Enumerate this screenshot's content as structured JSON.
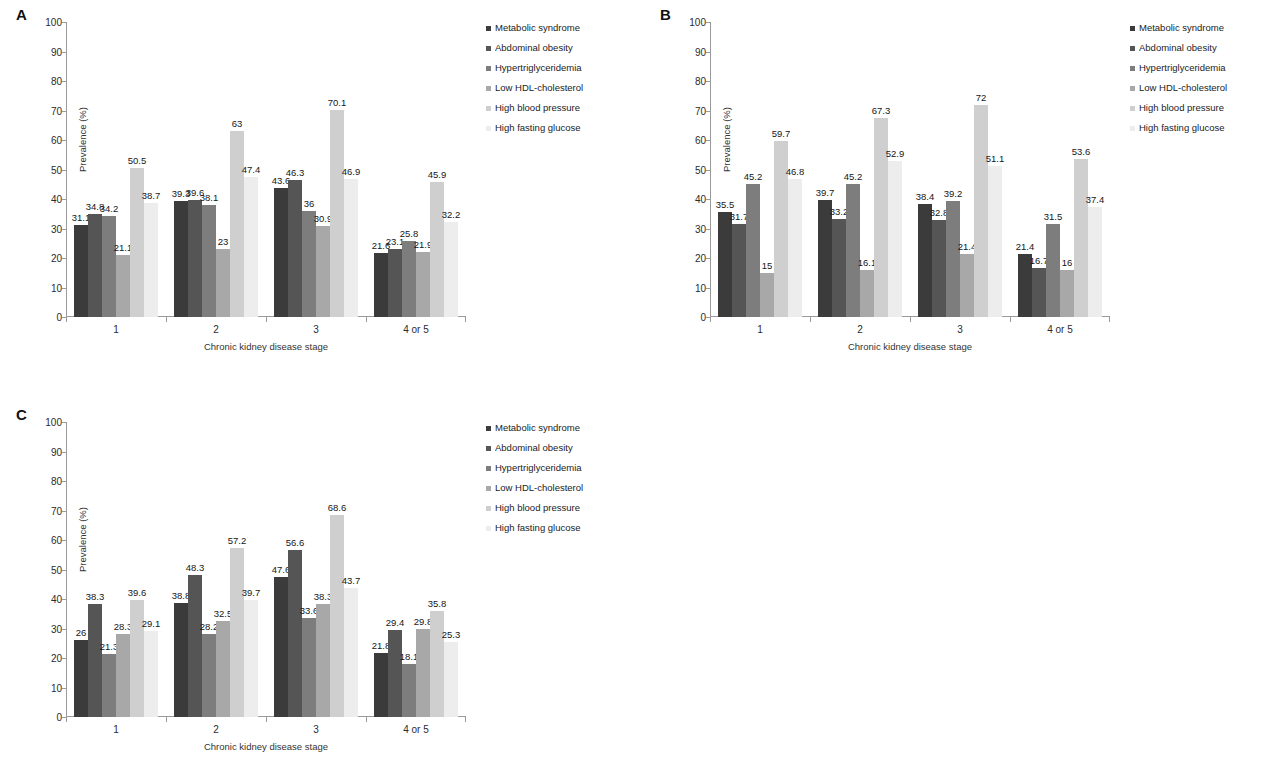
{
  "figure": {
    "y_axis_title": "Prevalence (%)",
    "x_axis_title": "Chronic kidney disease stage",
    "categories": [
      "1",
      "2",
      "3",
      "4 or 5"
    ],
    "y_ticks": [
      "0",
      "10",
      "20",
      "30",
      "40",
      "50",
      "60",
      "70",
      "80",
      "90",
      "100"
    ],
    "series_names": [
      "Metabolic syndrome",
      "Abdominal obesity",
      "Hypertriglyceridemia",
      "Low HDL-cholesterol",
      "High blood pressure",
      "High fasting glucose"
    ],
    "series_colors": [
      "#3b3b3b",
      "#555555",
      "#7d7d7d",
      "#a8a8a8",
      "#cfcfcf",
      "#ededed"
    ]
  },
  "panels": [
    {
      "letter": "A"
    },
    {
      "letter": "B"
    },
    {
      "letter": "C"
    }
  ],
  "chart_data": [
    {
      "type": "bar",
      "title": "A",
      "xlabel": "Chronic kidney disease stage",
      "ylabel": "Prevalence (%)",
      "ylim": [
        0,
        100
      ],
      "yticks": [
        0,
        10,
        20,
        30,
        40,
        50,
        60,
        70,
        80,
        90,
        100
      ],
      "grid": false,
      "legend_position": "right",
      "categories": [
        "1",
        "2",
        "3",
        "4 or 5"
      ],
      "series": [
        {
          "name": "Metabolic syndrome",
          "values": [
            31.1,
            39.3,
            43.6,
            21.6
          ]
        },
        {
          "name": "Abdominal obesity",
          "values": [
            34.8,
            39.6,
            46.3,
            23.1
          ]
        },
        {
          "name": "Hypertriglyceridemia",
          "values": [
            34.2,
            38.1,
            36.0,
            25.8
          ]
        },
        {
          "name": "Low HDL-cholesterol",
          "values": [
            21.1,
            23.0,
            30.9,
            21.9
          ]
        },
        {
          "name": "High blood pressure",
          "values": [
            50.5,
            63.0,
            70.1,
            45.9
          ]
        },
        {
          "name": "High fasting glucose",
          "values": [
            38.7,
            47.4,
            46.9,
            32.2
          ]
        }
      ],
      "labels": [
        [
          "31.1",
          "34.8",
          "34.2",
          "21.1",
          "50.5",
          "38.7"
        ],
        [
          "39.3",
          "39.6",
          "38.1",
          "23",
          "63",
          "47.4"
        ],
        [
          "43.6",
          "46.3",
          "36",
          "30.9",
          "70.1",
          "46.9"
        ],
        [
          "21.6",
          "23.1",
          "25.8",
          "21.9",
          "45.9",
          "32.2"
        ]
      ]
    },
    {
      "type": "bar",
      "title": "B",
      "xlabel": "Chronic kidney disease stage",
      "ylabel": "Prevalence (%)",
      "ylim": [
        0,
        100
      ],
      "yticks": [
        0,
        10,
        20,
        30,
        40,
        50,
        60,
        70,
        80,
        90,
        100
      ],
      "grid": false,
      "legend_position": "right",
      "categories": [
        "1",
        "2",
        "3",
        "4 or 5"
      ],
      "series": [
        {
          "name": "Metabolic syndrome",
          "values": [
            35.5,
            39.7,
            38.4,
            21.4
          ]
        },
        {
          "name": "Abdominal obesity",
          "values": [
            31.7,
            33.2,
            32.8,
            16.7
          ]
        },
        {
          "name": "Hypertriglyceridemia",
          "values": [
            45.2,
            45.2,
            39.2,
            31.5
          ]
        },
        {
          "name": "Low HDL-cholesterol",
          "values": [
            15.0,
            16.1,
            21.4,
            16.0
          ]
        },
        {
          "name": "High blood pressure",
          "values": [
            59.7,
            67.3,
            72.0,
            53.6
          ]
        },
        {
          "name": "High fasting glucose",
          "values": [
            46.8,
            52.9,
            51.1,
            37.4
          ]
        }
      ],
      "labels": [
        [
          "35.5",
          "31.7",
          "45.2",
          "15",
          "59.7",
          "46.8"
        ],
        [
          "39.7",
          "33.2",
          "45.2",
          "16.1",
          "67.3",
          "52.9"
        ],
        [
          "38.4",
          "32.8",
          "39.2",
          "21.4",
          "72",
          "51.1"
        ],
        [
          "21.4",
          "16.7",
          "31.5",
          "16",
          "53.6",
          "37.4"
        ]
      ]
    },
    {
      "type": "bar",
      "title": "C",
      "xlabel": "Chronic kidney disease stage",
      "ylabel": "Prevalence (%)",
      "ylim": [
        0,
        100
      ],
      "yticks": [
        0,
        10,
        20,
        30,
        40,
        50,
        60,
        70,
        80,
        90,
        100
      ],
      "grid": false,
      "legend_position": "right",
      "categories": [
        "1",
        "2",
        "3",
        "4 or 5"
      ],
      "series": [
        {
          "name": "Metabolic syndrome",
          "values": [
            26.0,
            38.8,
            47.6,
            21.8
          ]
        },
        {
          "name": "Abdominal obesity",
          "values": [
            38.3,
            48.3,
            56.6,
            29.4
          ]
        },
        {
          "name": "Hypertriglyceridemia",
          "values": [
            21.3,
            28.2,
            33.6,
            18.1
          ]
        },
        {
          "name": "Low HDL-cholesterol",
          "values": [
            28.3,
            32.5,
            38.3,
            29.8
          ]
        },
        {
          "name": "High blood pressure",
          "values": [
            39.6,
            57.2,
            68.6,
            35.8
          ]
        },
        {
          "name": "High fasting glucose",
          "values": [
            29.1,
            39.7,
            43.7,
            25.3
          ]
        }
      ],
      "labels": [
        [
          "26",
          "38.3",
          "21.3",
          "28.3",
          "39.6",
          "29.1"
        ],
        [
          "38.8",
          "48.3",
          "28.2",
          "32.5",
          "57.2",
          "39.7"
        ],
        [
          "47.6",
          "56.6",
          "33.6",
          "38.3",
          "68.6",
          "43.7"
        ],
        [
          "21.8",
          "29.4",
          "18.1",
          "29.8",
          "35.8",
          "25.3"
        ]
      ]
    }
  ]
}
